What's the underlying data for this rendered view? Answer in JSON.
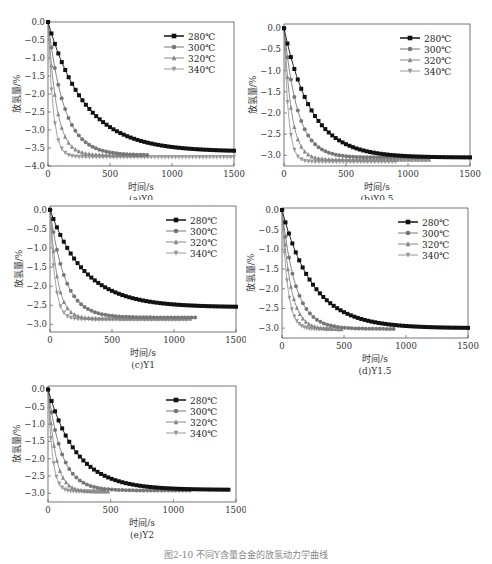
{
  "figure_caption": "图2-10 不同Y含量合金的放氢动力学曲线",
  "legend_labels": [
    "280℃",
    "300℃",
    "320℃",
    "340℃"
  ],
  "chart_data": [
    {
      "id": "a",
      "type": "line",
      "title": "(a)Y0",
      "xlabel": "时间/s",
      "ylabel": "放氢量/%",
      "xlim": [
        0,
        1500
      ],
      "ylim": [
        -4.0,
        0.0
      ],
      "xticks": [
        0,
        500,
        1000,
        1500
      ],
      "yticks": [
        0.0,
        -0.5,
        -1.0,
        -1.5,
        -2.0,
        -2.5,
        -3.0,
        -3.5,
        -4.0
      ],
      "series": [
        {
          "name": "280℃",
          "marker": "square",
          "color": "#111111",
          "tau": 300,
          "final": -3.6,
          "tmax": 1500
        },
        {
          "name": "300℃",
          "marker": "circle",
          "color": "#777777",
          "tau": 130,
          "final": -3.7,
          "tmax": 800
        },
        {
          "name": "320℃",
          "marker": "triangle-up",
          "color": "#888888",
          "tau": 70,
          "final": -3.7,
          "tmax": 800
        },
        {
          "name": "340℃",
          "marker": "triangle-down",
          "color": "#999999",
          "tau": 40,
          "final": -3.75,
          "tmax": 1500
        }
      ]
    },
    {
      "id": "b",
      "type": "line",
      "title": "(b)Y0.5",
      "xlabel": "时间/s",
      "ylabel": "放氢量/%",
      "xlim": [
        0,
        1500
      ],
      "ylim": [
        -3.25,
        0.1
      ],
      "xticks": [
        0,
        500,
        1000,
        1500
      ],
      "yticks": [
        0.0,
        -0.5,
        -1.0,
        -1.5,
        -2.0,
        -2.5,
        -3.0
      ],
      "series": [
        {
          "name": "280℃",
          "marker": "square",
          "color": "#111111",
          "tau": 220,
          "final": -3.05,
          "tmax": 1500
        },
        {
          "name": "300℃",
          "marker": "circle",
          "color": "#777777",
          "tau": 110,
          "final": -3.05,
          "tmax": 1170
        },
        {
          "name": "320℃",
          "marker": "triangle-up",
          "color": "#888888",
          "tau": 60,
          "final": -3.1,
          "tmax": 1170
        },
        {
          "name": "340℃",
          "marker": "triangle-down",
          "color": "#999999",
          "tau": 35,
          "final": -3.15,
          "tmax": 900
        }
      ]
    },
    {
      "id": "c",
      "type": "line",
      "title": "(c)Y1",
      "xlabel": "时间/s",
      "ylabel": "放氢量/%",
      "xlim": [
        0,
        1500
      ],
      "ylim": [
        -3.2,
        0.1
      ],
      "xticks": [
        0,
        500,
        1000,
        1500
      ],
      "yticks": [
        0.0,
        -0.5,
        -1.0,
        -1.5,
        -2.0,
        -2.5,
        -3.0
      ],
      "series": [
        {
          "name": "280℃",
          "marker": "square",
          "color": "#111111",
          "tau": 280,
          "final": -2.55,
          "tmax": 1500
        },
        {
          "name": "300℃",
          "marker": "circle",
          "color": "#777777",
          "tau": 120,
          "final": -2.82,
          "tmax": 1170
        },
        {
          "name": "320℃",
          "marker": "triangle-up",
          "color": "#888888",
          "tau": 60,
          "final": -2.85,
          "tmax": 1130
        },
        {
          "name": "340℃",
          "marker": "triangle-down",
          "color": "#999999",
          "tau": 40,
          "final": -2.87,
          "tmax": 1100
        }
      ]
    },
    {
      "id": "d",
      "type": "line",
      "title": "(d)Y1.5",
      "xlabel": "时间/s",
      "ylabel": "放氢量/%",
      "xlim": [
        0,
        1500
      ],
      "ylim": [
        -3.25,
        0.05
      ],
      "xticks": [
        0,
        500,
        1000,
        1500
      ],
      "yticks": [
        0.0,
        -0.5,
        -1.0,
        -1.5,
        -2.0,
        -2.5,
        -3.0
      ],
      "series": [
        {
          "name": "280℃",
          "marker": "square",
          "color": "#111111",
          "tau": 250,
          "final": -3.0,
          "tmax": 1500
        },
        {
          "name": "300℃",
          "marker": "circle",
          "color": "#777777",
          "tau": 110,
          "final": -3.02,
          "tmax": 900
        },
        {
          "name": "320℃",
          "marker": "triangle-up",
          "color": "#888888",
          "tau": 70,
          "final": -3.03,
          "tmax": 480
        },
        {
          "name": "340℃",
          "marker": "triangle-down",
          "color": "#999999",
          "tau": 45,
          "final": -3.03,
          "tmax": 400
        }
      ]
    },
    {
      "id": "e",
      "type": "line",
      "title": "(e)Y2",
      "xlabel": "时间/s",
      "ylabel": "放氢量/%",
      "xlim": [
        0,
        1500
      ],
      "ylim": [
        -3.25,
        0.1
      ],
      "xticks": [
        0,
        500,
        1000,
        1500
      ],
      "yticks": [
        0.0,
        -0.5,
        -1.0,
        -1.5,
        -2.0,
        -2.5,
        -3.0
      ],
      "series": [
        {
          "name": "280℃",
          "marker": "square",
          "color": "#111111",
          "tau": 230,
          "final": -2.9,
          "tmax": 1440
        },
        {
          "name": "300℃",
          "marker": "circle",
          "color": "#777777",
          "tau": 110,
          "final": -2.92,
          "tmax": 1130
        },
        {
          "name": "320℃",
          "marker": "triangle-up",
          "color": "#888888",
          "tau": 60,
          "final": -2.95,
          "tmax": 480
        },
        {
          "name": "340℃",
          "marker": "triangle-down",
          "color": "#999999",
          "tau": 35,
          "final": -2.95,
          "tmax": 450
        }
      ]
    }
  ],
  "layout": [
    {
      "left": 0,
      "top": 0,
      "w": 246,
      "h": 200,
      "plot": [
        48,
        22,
        186,
        144
      ]
    },
    {
      "left": 246,
      "top": 0,
      "w": 246,
      "h": 200,
      "plot": [
        38,
        24,
        186,
        142
      ]
    },
    {
      "left": 0,
      "top": 200,
      "w": 246,
      "h": 190,
      "plot": [
        50,
        6,
        186,
        126
      ]
    },
    {
      "left": 246,
      "top": 200,
      "w": 246,
      "h": 190,
      "plot": [
        36,
        8,
        186,
        130
      ]
    },
    {
      "left": 0,
      "top": 380,
      "w": 246,
      "h": 168,
      "plot": [
        48,
        6,
        188,
        116
      ]
    }
  ]
}
